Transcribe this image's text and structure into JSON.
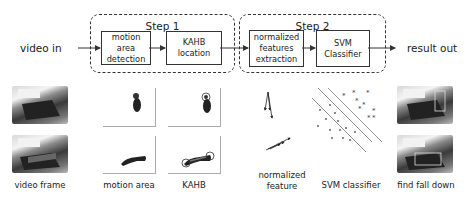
{
  "pipeline": {
    "input_label": "video in",
    "output_label": "result out",
    "steps": [
      {
        "title": "Step 1",
        "boxes": [
          {
            "text": "motion area detection"
          },
          {
            "text": "KAHB location"
          }
        ]
      },
      {
        "title": "Step 2",
        "boxes": [
          {
            "text": "normalized features extraction"
          },
          {
            "text": "SVM Classifier"
          }
        ]
      }
    ]
  },
  "illustrations": {
    "video_frame": {
      "caption": "video frame"
    },
    "motion_area": {
      "caption": "motion area"
    },
    "kahb": {
      "caption": "KAHB"
    },
    "normalized_feature": {
      "caption_line1": "normalized",
      "caption_line2": "feature"
    },
    "svm_classifier": {
      "caption": "SVM classifier"
    },
    "find_fall_down": {
      "caption": "find fall down"
    }
  },
  "colors": {
    "line": "#333333",
    "text": "#222222",
    "background": "#ffffff"
  }
}
